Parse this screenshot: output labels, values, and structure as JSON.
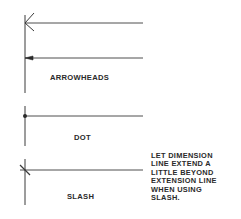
{
  "diagram": {
    "labels": {
      "arrowheads": "ARROWHEADS",
      "dot": "DOT",
      "slash": "SLASH"
    },
    "note": {
      "lines": [
        "LET DIMENSION",
        "LINE EXTEND A",
        "LITTLE BEYOND",
        "EXTENSION LINE",
        "WHEN USING",
        "SLASH."
      ]
    },
    "terminators": [
      {
        "type": "open-arrowhead"
      },
      {
        "type": "filled-arrowhead"
      },
      {
        "type": "dot"
      },
      {
        "type": "slash"
      }
    ],
    "colors": {
      "line": "#3a3a3a",
      "background": "#ffffff"
    }
  }
}
